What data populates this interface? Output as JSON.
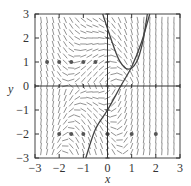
{
  "chart_data": {
    "type": "scatter",
    "subtype": "slope_field",
    "title": "",
    "xlabel": "x",
    "ylabel": "y",
    "xlim": [
      -3,
      3
    ],
    "ylim": [
      -3,
      3
    ],
    "x_ticks": [
      "-3",
      "-2",
      "-1",
      "0",
      "1",
      "2",
      "3"
    ],
    "y_ticks": [
      "-3",
      "-2",
      "-1",
      "0",
      "1",
      "2",
      "3"
    ],
    "grid": false,
    "legend": null,
    "points": [
      {
        "x": -2.5,
        "y": 1
      },
      {
        "x": -2,
        "y": 1
      },
      {
        "x": -1.5,
        "y": 1
      },
      {
        "x": -1,
        "y": 1
      },
      {
        "x": -0.5,
        "y": 1
      },
      {
        "x": -2,
        "y": -2
      },
      {
        "x": -1.5,
        "y": -2
      },
      {
        "x": -1,
        "y": -2
      },
      {
        "x": 0,
        "y": -2
      },
      {
        "x": 1,
        "y": -2
      },
      {
        "x": 2,
        "y": -2
      }
    ],
    "curves": [
      {
        "name": "solution-curve-1",
        "points": [
          [
            -0.2,
            3
          ],
          [
            0.2,
            1.8
          ],
          [
            0.5,
            1.05
          ],
          [
            0.85,
            0.7
          ],
          [
            1.2,
            1.0
          ],
          [
            1.45,
            1.8
          ],
          [
            1.65,
            3
          ]
        ]
      },
      {
        "name": "solution-curve-2",
        "points": [
          [
            -0.9,
            -3
          ],
          [
            -0.5,
            -1.8
          ],
          [
            0,
            -1
          ],
          [
            0.55,
            0
          ],
          [
            1.0,
            0.8
          ],
          [
            1.4,
            1.8
          ],
          [
            1.75,
            3
          ]
        ]
      }
    ]
  },
  "axes": {
    "xlabel": "x",
    "ylabel": "y"
  }
}
